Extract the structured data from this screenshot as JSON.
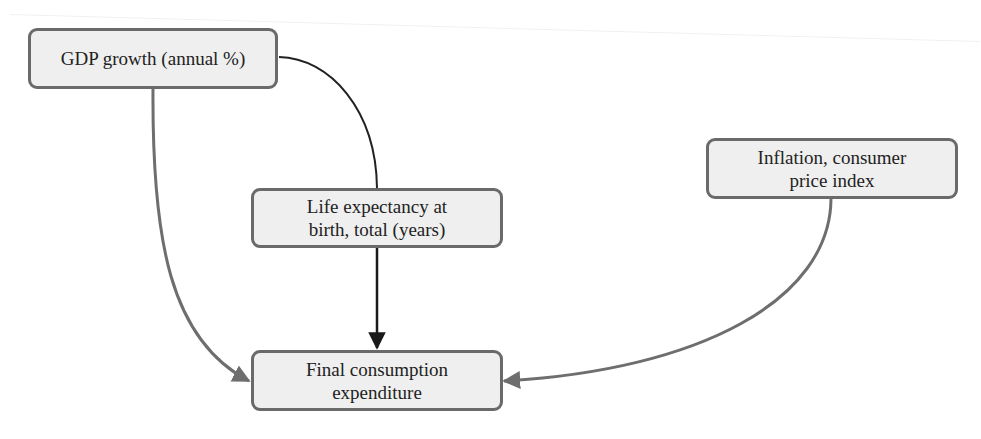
{
  "diagram": {
    "type": "causal-graph",
    "nodes": [
      {
        "id": "gdp",
        "label_lines": [
          "GDP growth (annual %)"
        ]
      },
      {
        "id": "life",
        "label_lines": [
          "Life expectancy at",
          "birth, total (years)"
        ]
      },
      {
        "id": "inflation",
        "label_lines": [
          "Inflation, consumer",
          "price index"
        ]
      },
      {
        "id": "final",
        "label_lines": [
          "Final consumption",
          "expenditure"
        ]
      }
    ],
    "edges": [
      {
        "from": "gdp",
        "to": "final",
        "color": "#6e6e6e",
        "arrow": true
      },
      {
        "from": "gdp",
        "to": "life",
        "color": "#222222",
        "arrow": false
      },
      {
        "from": "life",
        "to": "final",
        "color": "#1a1a1a",
        "arrow": true
      },
      {
        "from": "inflation",
        "to": "final",
        "color": "#6e6e6e",
        "arrow": true
      }
    ],
    "colors": {
      "node_fill": "#efefef",
      "node_border": "#6a6a6a",
      "text": "#222222",
      "edge_gray": "#6e6e6e",
      "edge_black": "#1a1a1a"
    }
  }
}
